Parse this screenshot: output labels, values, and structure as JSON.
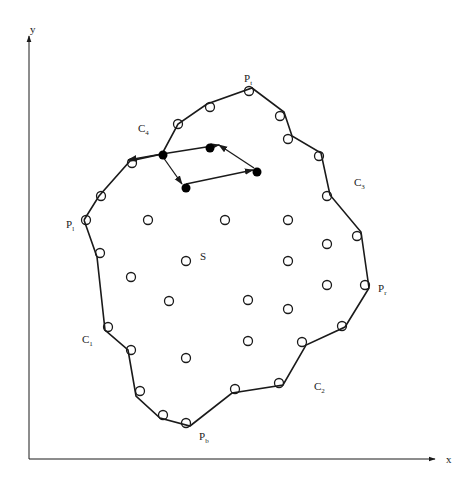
{
  "diagram": {
    "type": "region boundary contour with interior sample points",
    "axes": {
      "x_label": "x",
      "y_label": "y",
      "origin": [
        29,
        459
      ],
      "x_end": [
        435,
        459
      ],
      "y_end": [
        29,
        36
      ],
      "x_label_pos": [
        446,
        463
      ],
      "y_label_pos": [
        30,
        33
      ]
    },
    "labels": [
      {
        "id": "P_t",
        "base": "P",
        "sub": "t",
        "x": 244,
        "y": 82
      },
      {
        "id": "P_l",
        "base": "P",
        "sub": "l",
        "x": 66,
        "y": 228
      },
      {
        "id": "P_r",
        "base": "P",
        "sub": "r",
        "x": 378,
        "y": 292
      },
      {
        "id": "P_b",
        "base": "P",
        "sub": "b",
        "x": 199,
        "y": 440
      },
      {
        "id": "C_1",
        "base": "C",
        "sub": "1",
        "x": 82,
        "y": 343
      },
      {
        "id": "C_2",
        "base": "C",
        "sub": "2",
        "x": 314,
        "y": 390
      },
      {
        "id": "C_3",
        "base": "C",
        "sub": "3",
        "x": 354,
        "y": 186
      },
      {
        "id": "C_4",
        "base": "C",
        "sub": "4",
        "x": 138,
        "y": 132
      },
      {
        "id": "S",
        "base": "S",
        "sub": "",
        "x": 200,
        "y": 260
      }
    ],
    "boundary_polygon": [
      [
        84,
        220
      ],
      [
        99,
        196
      ],
      [
        130,
        161
      ],
      [
        162,
        154
      ],
      [
        178,
        124
      ],
      [
        207,
        104
      ],
      [
        252,
        88
      ],
      [
        284,
        112
      ],
      [
        292,
        136
      ],
      [
        321,
        153
      ],
      [
        330,
        195
      ],
      [
        361,
        232
      ],
      [
        369,
        288
      ],
      [
        345,
        327
      ],
      [
        306,
        345
      ],
      [
        283,
        385
      ],
      [
        232,
        393
      ],
      [
        190,
        426
      ],
      [
        160,
        418
      ],
      [
        136,
        396
      ],
      [
        128,
        350
      ],
      [
        105,
        330
      ],
      [
        97,
        257
      ],
      [
        84,
        220
      ]
    ],
    "boundary_arrow": {
      "from": [
        162,
        154
      ],
      "to": [
        128,
        160
      ]
    },
    "boundary_circles": [
      [
        86,
        220
      ],
      [
        101,
        196
      ],
      [
        132,
        163
      ],
      [
        178,
        124
      ],
      [
        210,
        107
      ],
      [
        249,
        91
      ],
      [
        280,
        116
      ],
      [
        288,
        139
      ],
      [
        319,
        156
      ],
      [
        327,
        196
      ],
      [
        357,
        236
      ],
      [
        365,
        285
      ],
      [
        342,
        326
      ],
      [
        302,
        342
      ],
      [
        279,
        383
      ],
      [
        235,
        389
      ],
      [
        186,
        423
      ],
      [
        163,
        415
      ],
      [
        140,
        391
      ],
      [
        131,
        350
      ],
      [
        108,
        327
      ],
      [
        100,
        253
      ]
    ],
    "interior_circles": [
      [
        148,
        220
      ],
      [
        225,
        220
      ],
      [
        288,
        220
      ],
      [
        327,
        244
      ],
      [
        186,
        261
      ],
      [
        288,
        261
      ],
      [
        131,
        277
      ],
      [
        327,
        285
      ],
      [
        169,
        301
      ],
      [
        248,
        300
      ],
      [
        288,
        309
      ],
      [
        248,
        341
      ],
      [
        186,
        358
      ]
    ],
    "filled_points": [
      {
        "id": "f1",
        "x": 163,
        "y": 155
      },
      {
        "id": "f2",
        "x": 210,
        "y": 148
      },
      {
        "id": "f3",
        "x": 257,
        "y": 172
      },
      {
        "id": "f4",
        "x": 186,
        "y": 188
      }
    ],
    "path_arrows": [
      {
        "from": [
          162,
          154
        ],
        "to": [
          219,
          145
        ]
      },
      {
        "from": [
          219,
          145
        ],
        "to": [
          254,
          168
        ],
        "reverse_arrow_at": [
          219,
          145
        ]
      },
      {
        "from": [
          186,
          184
        ],
        "to": [
          253,
          170
        ]
      },
      {
        "from": [
          163,
          157
        ],
        "to": [
          182,
          184
        ]
      }
    ],
    "colors": {
      "line": "#1a1a1a",
      "background": "#ffffff",
      "fill_point": "#000000"
    }
  }
}
